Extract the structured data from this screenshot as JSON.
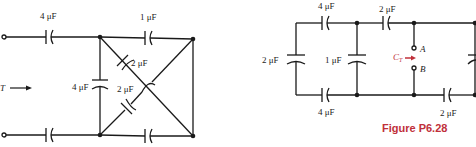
{
  "left_circuit": {
    "labels": {
      "top_left_cap": "4 μF",
      "top_right_cap": "1 μF",
      "diag_cap_upper": "2 μF",
      "diag_cap_lower": "2 μF",
      "vertical_cap": "4 μF",
      "ct_arrow_label": "T"
    }
  },
  "right_circuit": {
    "labels": {
      "top_left_cap": "4 μF",
      "top_mid_cap": "2 μF",
      "left_vertical_cap": "2 μF",
      "mid_vertical_cap": "1 μF",
      "bottom_left_cap": "4 μF",
      "bottom_right_cap": "2 μF",
      "ct_label": "C",
      "ct_sub": "T",
      "terminal_a": "A",
      "terminal_b": "B"
    }
  },
  "caption": "Figure P6.28",
  "colors": {
    "wire": "#1a1a1a",
    "accent": "#c0303a"
  }
}
